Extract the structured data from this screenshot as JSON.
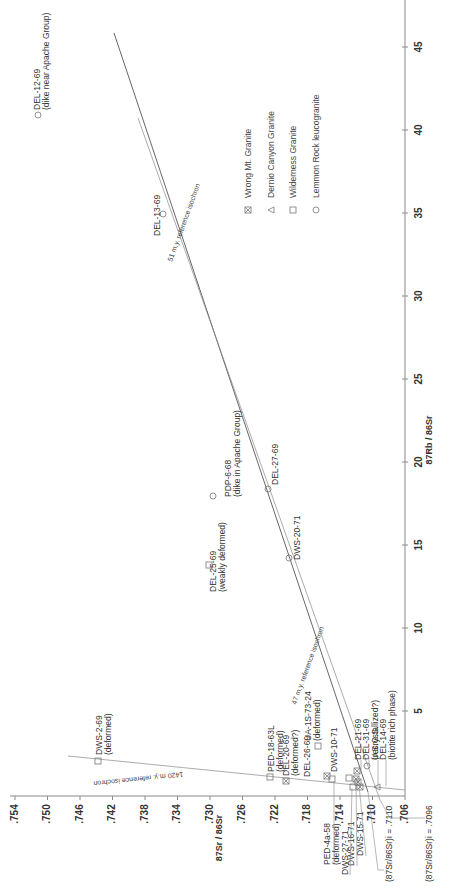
{
  "chart_data": {
    "type": "scatter",
    "orientation": "rotated-90-ccw",
    "title": "",
    "xlabel": "87Rb/86Sr",
    "ylabel": "87Sr/86Sr",
    "xlim": [
      0,
      47
    ],
    "ylim": [
      0.706,
      0.755
    ],
    "x_ticks": [
      "5",
      "10",
      "15",
      "20",
      "25",
      "30",
      "35",
      "40",
      "45"
    ],
    "y_ticks": [
      ".706",
      ".710",
      ".714",
      ".718",
      ".722",
      ".726",
      ".730",
      ".734",
      ".738",
      ".742",
      ".746",
      ".750",
      ".754"
    ],
    "legend": [
      {
        "symbol": "crossed-square",
        "label": "Wrong Mt. Granite"
      },
      {
        "symbol": "triangle",
        "label": "Dernio Canyon Granite"
      },
      {
        "symbol": "square",
        "label": "Wilderness Granite"
      },
      {
        "symbol": "circle",
        "label": "Lemmon Rock leucogranite"
      }
    ],
    "isochrons": [
      {
        "label": "51 m.y. reference isochron",
        "x": [
          0,
          46
        ],
        "y": [
          0.7096,
          0.7427
        ]
      },
      {
        "label": "47 m.y. reference isochron",
        "x": [
          0,
          41
        ],
        "y": [
          0.711,
          0.7383
        ]
      },
      {
        "label": "1420 m.y. reference isochron",
        "x": [
          0,
          2.7
        ],
        "y": [
          0.7077,
          0.756
        ]
      }
    ],
    "intercepts": [
      {
        "label": "(87Sr/86Sr)i = .7110",
        "value": 0.711
      },
      {
        "label": "(87Sr/86Sr)i = .7096",
        "value": 0.7096
      }
    ],
    "points": [
      {
        "id": "DEL-12-69",
        "note": "(dike near Apache Group)",
        "symbol": "circle",
        "x": 41.7,
        "y": 0.7549
      },
      {
        "id": "DEL-13-69",
        "note": "",
        "symbol": "circle",
        "x": 34.9,
        "y": 0.735
      },
      {
        "id": "PDP-6-68",
        "note": "(dike in Apache Group)",
        "symbol": "circle",
        "x": 18.1,
        "y": 0.7298
      },
      {
        "id": "DEL-27-69",
        "note": "",
        "symbol": "circle",
        "x": 18.6,
        "y": 0.7226
      },
      {
        "id": "DEL-25-69",
        "note": "(weakly deformed)",
        "symbol": "square",
        "x": 13.8,
        "y": 0.7306
      },
      {
        "id": "DWS-20-71",
        "note": "",
        "symbol": "circle",
        "x": 14.3,
        "y": 0.7202
      },
      {
        "id": "DWS-2-69",
        "note": "(deformed)",
        "symbol": "square",
        "x": 2.3,
        "y": 0.7447
      },
      {
        "id": "PED-18-63L",
        "note": "(deformed)",
        "symbol": "square",
        "x": 1.5,
        "y": 0.7227
      },
      {
        "id": "DEL-20-69",
        "note": "(deformed?)",
        "symbol": "crossed-square",
        "x": 1.0,
        "y": 0.7209
      },
      {
        "id": "UA-1S-73-24",
        "note": "(deformed)",
        "symbol": "square",
        "x": 3.6,
        "y": 0.718
      },
      {
        "id": "DEL-26-69",
        "note": "",
        "symbol": "crossed-square",
        "x": 1.5,
        "y": 0.7164
      },
      {
        "id": "PED-4a-58",
        "note": "(deformed)",
        "symbol": "square",
        "x": 1.1,
        "y": 0.7156
      },
      {
        "id": "DWS-10-71",
        "note": "",
        "symbol": "square",
        "x": 1.3,
        "y": 0.7138
      },
      {
        "id": "DWS-27-71",
        "note": "",
        "symbol": "square",
        "x": 1.0,
        "y": 0.7134
      },
      {
        "id": "DWS-16-71",
        "note": "",
        "symbol": "crossed-square",
        "x": 1.6,
        "y": 0.7126
      },
      {
        "id": "DWS-15-71",
        "note": "",
        "symbol": "crossed-square",
        "x": 1.3,
        "y": 0.7122
      },
      {
        "id": "DEL-21-69",
        "note": "",
        "symbol": "crossed-square",
        "x": 2.1,
        "y": 0.7126
      },
      {
        "id": "DEL-31-69",
        "note": "(recrystallized?)",
        "symbol": "circle",
        "x": 2.3,
        "y": 0.7108
      },
      {
        "id": "U.S.G.S.",
        "note": "",
        "symbol": "crossed-square",
        "x": 1.2,
        "y": 0.7118
      },
      {
        "id": "DEL-14-69",
        "note": "(biotite rich phase)",
        "symbol": "triangle",
        "x": 0.5,
        "y": 0.7104
      }
    ]
  },
  "labels": {
    "iso51": "51 m.y. reference isochron",
    "iso47": "47 m.y. reference isochron",
    "iso1420": "1420 m.y. reference isochron",
    "int7110": "(87Sr/86Sr)i = .7110",
    "int7096": "(87Sr/86Sr)i = .7096",
    "xaxis": "87Rb / 86Sr",
    "yaxis": "87Sr / 86Sr"
  }
}
